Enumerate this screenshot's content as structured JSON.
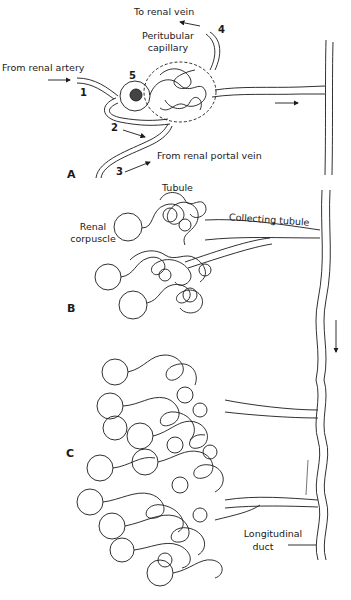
{
  "figure": {
    "panels": [
      {
        "id": "A",
        "label": "A"
      },
      {
        "id": "B",
        "label": "B"
      },
      {
        "id": "C",
        "label": "C"
      }
    ],
    "panel_a": {
      "labels": {
        "to_renal_vein": "To renal vein",
        "peritubular_capillary_line1": "Peritubular",
        "peritubular_capillary_line2": "capillary",
        "from_renal_artery": "From renal artery",
        "from_renal_portal_vein": "From renal portal vein"
      },
      "numbers": [
        "1",
        "2",
        "3",
        "4",
        "5"
      ]
    },
    "panel_b": {
      "labels": {
        "tubule": "Tubule",
        "renal_corpuscle_line1": "Renal",
        "renal_corpuscle_line2": "corpuscle",
        "collecting_tubule": "Collecting tubule"
      }
    },
    "panel_c": {
      "labels": {
        "longitudinal_duct_line1": "Longitudinal",
        "longitudinal_duct_line2": "duct"
      }
    },
    "caption": {
      "text": "",
      "note": "caption cropped at bottom edge; illegible"
    },
    "colors": {
      "ink": "#1a1a1a",
      "background": "#ffffff"
    }
  }
}
